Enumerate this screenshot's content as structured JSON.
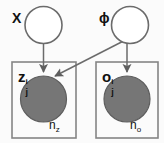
{
  "diagram": {
    "type": "plate-notation-graphical-model",
    "background_color": "#fbfbfb",
    "stroke_color": "#6b6b6b",
    "observed_fill_color": "#767676",
    "latent_fill_color": "#ffffff",
    "nodes": [
      {
        "id": "chi",
        "label": "X",
        "kind": "latent-empty-circle",
        "cx": 43.5,
        "cy": 25,
        "r": 18.5,
        "label_x": 12,
        "label_y": 6
      },
      {
        "id": "phi",
        "label": "ϕ",
        "kind": "latent-empty-circle",
        "cx": 130,
        "cy": 25,
        "r": 18.5,
        "label_x": 99,
        "label_y": 6
      },
      {
        "id": "z",
        "base": "z",
        "superscript": "i",
        "subscript": "j",
        "kind": "observed-filled-circle",
        "cx": 43.5,
        "cy": 99,
        "r": 23,
        "label_x": 18,
        "label_y": 68
      },
      {
        "id": "o",
        "base": "o",
        "superscript": "i",
        "subscript": "j",
        "kind": "observed-filled-circle",
        "cx": 127,
        "cy": 99,
        "r": 23,
        "label_x": 102,
        "label_y": 68
      }
    ],
    "plates": [
      {
        "id": "plate-z",
        "count_label_base": "n",
        "count_label_sub": "z",
        "x": 12,
        "y": 62,
        "width": 64,
        "height": 76,
        "count_x": 49,
        "count_y": 119
      },
      {
        "id": "plate-o",
        "count_label_base": "n",
        "count_label_sub": "o",
        "x": 96,
        "y": 62,
        "width": 62,
        "height": 76,
        "count_x": 130,
        "count_y": 119
      }
    ],
    "edges": [
      {
        "id": "edge-chi-to-z",
        "from": "chi",
        "to": "z",
        "path": "M 43.5 43.5 L 43.5 73"
      },
      {
        "id": "edge-phi-to-o",
        "from": "phi",
        "to": "o",
        "path": "M 127 43.5 L 127 73"
      },
      {
        "id": "edge-phi-to-z",
        "from": "phi",
        "to": "z",
        "path": "M 122 42 L 54 77"
      }
    ]
  }
}
